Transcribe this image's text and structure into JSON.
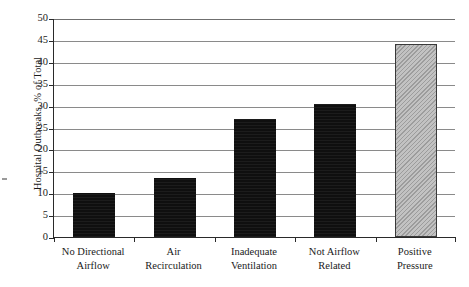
{
  "chart_data": {
    "type": "bar",
    "title": "",
    "xlabel": "",
    "ylabel": "Hospital Outbreaks, % of Total",
    "ylim": [
      0,
      50
    ],
    "ytick_step": 5,
    "yticks": [
      50,
      45,
      40,
      35,
      30,
      25,
      20,
      15,
      10,
      5,
      0
    ],
    "grid": true,
    "grid_axis": "y",
    "legend": false,
    "legend_position": "none",
    "categories": [
      "No Directional Airflow",
      "Air Recirculation",
      "Inadequate Ventilation",
      "Not Airflow Related",
      "Positive Pressure"
    ],
    "category_lines": [
      [
        "No Directional",
        "Airflow"
      ],
      [
        "Air",
        "Recirculation"
      ],
      [
        "Inadequate",
        "Ventilation"
      ],
      [
        "Not Airflow",
        "Related"
      ],
      [
        "Positive",
        "Pressure"
      ]
    ],
    "values": [
      10,
      13.5,
      27,
      30.3,
      44
    ],
    "bar_styles": [
      "dark",
      "dark",
      "dark",
      "dark",
      "hatched"
    ],
    "colors": {
      "bar_dark": "#0f0f0f",
      "bar_hatched_fill": "#c2c2c2",
      "bar_hatched_border": "#3a3a3a",
      "gridline": "#8a8a8a",
      "axis": "#2a2a2a",
      "background": "#ffffff",
      "text": "#1a1a1a"
    }
  }
}
